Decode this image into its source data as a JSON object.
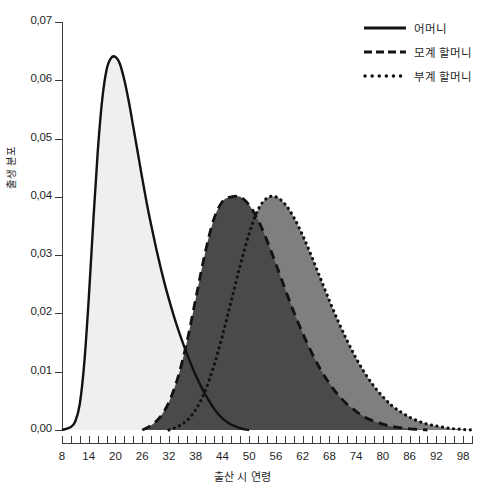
{
  "chart_data": {
    "type": "area",
    "title": "",
    "xlabel": "출산 시 연령",
    "ylabel": "출생 분포",
    "xlim": [
      8,
      100
    ],
    "ylim": [
      0.0,
      0.07
    ],
    "grid": false,
    "legend_position": "top-right",
    "x_ticks_major": [
      8,
      14,
      20,
      26,
      32,
      38,
      44,
      50,
      56,
      62,
      68,
      74,
      80,
      86,
      92,
      98
    ],
    "x_tick_labels": [
      "8",
      "14",
      "20",
      "26",
      "32",
      "38",
      "44",
      "50",
      "56",
      "62",
      "68",
      "74",
      "80",
      "86",
      "92",
      "98"
    ],
    "x_tick_step_minor": 2,
    "y_ticks": [
      0.0,
      0.01,
      0.02,
      0.03,
      0.04,
      0.05,
      0.06,
      0.07
    ],
    "y_tick_labels": [
      "0,00",
      "0,01",
      "0,02",
      "0,03",
      "0,04",
      "0,05",
      "0,06",
      "0,07"
    ],
    "series": [
      {
        "name": "어머니",
        "line_style": "solid",
        "line_color": "#121212",
        "fill_color": "#efefef",
        "peak_x": 20,
        "peak_y": 0.064,
        "x": [
          8,
          10,
          11,
          12,
          13,
          14,
          15,
          16,
          17,
          18,
          19,
          20,
          21,
          22,
          23,
          24,
          25,
          26,
          27,
          28,
          29,
          30,
          31,
          32,
          33,
          34,
          35,
          36,
          37,
          38,
          39,
          40,
          41,
          42,
          43,
          44,
          45,
          46,
          47,
          48,
          49,
          50
        ],
        "y": [
          0.0,
          0.0005,
          0.0015,
          0.0045,
          0.0115,
          0.0225,
          0.0355,
          0.0475,
          0.0565,
          0.0618,
          0.0638,
          0.064,
          0.0628,
          0.06,
          0.0563,
          0.052,
          0.0476,
          0.0432,
          0.039,
          0.0352,
          0.0316,
          0.0283,
          0.0252,
          0.0224,
          0.0198,
          0.0174,
          0.0152,
          0.0131,
          0.0112,
          0.0094,
          0.0078,
          0.0063,
          0.005,
          0.0038,
          0.0028,
          0.002,
          0.0014,
          0.0009,
          0.0006,
          0.0003,
          0.0001,
          0.0
        ]
      },
      {
        "name": "모계 할머니",
        "line_style": "dashed",
        "line_color": "#121212",
        "fill_color": "#4a4a4a",
        "peak_x": 48,
        "peak_y": 0.04,
        "x": [
          26,
          28,
          30,
          32,
          34,
          36,
          38,
          40,
          42,
          44,
          46,
          48,
          50,
          52,
          54,
          56,
          58,
          60,
          62,
          64,
          66,
          68,
          70,
          72,
          74,
          76,
          78,
          80,
          82,
          84,
          86,
          88,
          90
        ],
        "y": [
          0.0,
          0.0008,
          0.0022,
          0.0048,
          0.009,
          0.015,
          0.0225,
          0.03,
          0.036,
          0.0392,
          0.04,
          0.04,
          0.0386,
          0.036,
          0.0325,
          0.0285,
          0.0243,
          0.0203,
          0.0166,
          0.0133,
          0.0104,
          0.008,
          0.006,
          0.0044,
          0.0032,
          0.0022,
          0.0015,
          0.001,
          0.0006,
          0.0004,
          0.0002,
          0.0001,
          0.0
        ]
      },
      {
        "name": "부계 할머니",
        "line_style": "dotted",
        "line_color": "#121212",
        "fill_color": "#7f7f7f",
        "peak_x": 55,
        "peak_y": 0.04,
        "x": [
          32,
          34,
          36,
          38,
          40,
          42,
          44,
          46,
          48,
          50,
          52,
          54,
          56,
          58,
          60,
          62,
          64,
          66,
          68,
          70,
          72,
          74,
          76,
          78,
          80,
          82,
          84,
          86,
          88,
          90,
          92,
          94,
          96,
          98,
          100
        ],
        "y": [
          0.0,
          0.0006,
          0.0016,
          0.0035,
          0.0065,
          0.0108,
          0.0162,
          0.0222,
          0.0283,
          0.0337,
          0.0378,
          0.0398,
          0.04,
          0.0388,
          0.0365,
          0.0334,
          0.0298,
          0.026,
          0.0222,
          0.0186,
          0.0153,
          0.0123,
          0.0097,
          0.0075,
          0.0057,
          0.0042,
          0.0031,
          0.0022,
          0.0015,
          0.001,
          0.0007,
          0.0004,
          0.0002,
          0.0001,
          0.0
        ]
      }
    ]
  },
  "legend": {
    "items": [
      {
        "label": "어머니",
        "style": "solid"
      },
      {
        "label": "모계 할머니",
        "style": "dashed"
      },
      {
        "label": "부계 할머니",
        "style": "dotted"
      }
    ]
  },
  "axes": {
    "x_title": "출산 시 연령",
    "y_title": "출생 분포"
  },
  "colors": {
    "mother_fill": "#efefef",
    "maternal_fill": "#4a4a4a",
    "paternal_fill": "#7f7f7f",
    "line": "#121212",
    "axis": "#3b3b3b"
  }
}
